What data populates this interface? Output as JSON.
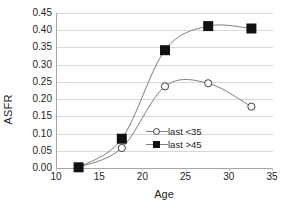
{
  "chart_data": {
    "type": "line",
    "title": "",
    "xlabel": "Age",
    "ylabel": "ASFR",
    "xlim": [
      10,
      35
    ],
    "ylim": [
      0.0,
      0.45
    ],
    "grid": true,
    "legend_position": "inside-center-lower",
    "x": [
      12.5,
      17.5,
      22.5,
      27.5,
      32.5
    ],
    "xticks": [
      "10",
      "15",
      "20",
      "25",
      "30",
      "35"
    ],
    "xtick_values": [
      10,
      15,
      20,
      25,
      30,
      35
    ],
    "yticks": [
      "0.00",
      "0.05",
      "0.10",
      "0.15",
      "0.20",
      "0.25",
      "0.30",
      "0.35",
      "0.40",
      "0.45"
    ],
    "ytick_values": [
      0.0,
      0.05,
      0.1,
      0.15,
      0.2,
      0.25,
      0.3,
      0.35,
      0.4,
      0.45
    ],
    "series": [
      {
        "name": "last <35",
        "marker": "open-circle",
        "color": "#404040",
        "values": [
          0.002,
          0.058,
          0.237,
          0.246,
          0.178
        ]
      },
      {
        "name": "last >45",
        "marker": "filled-square",
        "color": "#111111",
        "values": [
          0.002,
          0.085,
          0.342,
          0.412,
          0.405
        ]
      }
    ]
  },
  "legend": {
    "items": [
      {
        "label": "last <35",
        "marker": "open-circle"
      },
      {
        "label": "last >45",
        "marker": "filled-square"
      }
    ]
  },
  "colors": {
    "gridline": "#d9d9d9",
    "axis": "#a6a6a6",
    "line": "#7f7f7f",
    "text": "#231f20",
    "background": "#ffffff"
  }
}
